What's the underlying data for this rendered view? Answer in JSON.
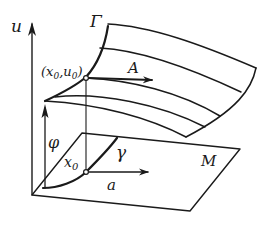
{
  "diagram": {
    "labels": {
      "u_axis": "u",
      "surface": "Γ",
      "point_top": "(x",
      "point_top_sub0": "0",
      "point_top_mid": ",u",
      "point_top_sub1": "0",
      "point_top_close": ")",
      "vector_A": "A",
      "phi": "φ",
      "x0": "x",
      "x0_sub": "0",
      "gamma": "γ",
      "vector_a": "a",
      "plane": "M"
    },
    "colors": {
      "stroke": "#1a1a1a",
      "background": "#ffffff"
    }
  }
}
